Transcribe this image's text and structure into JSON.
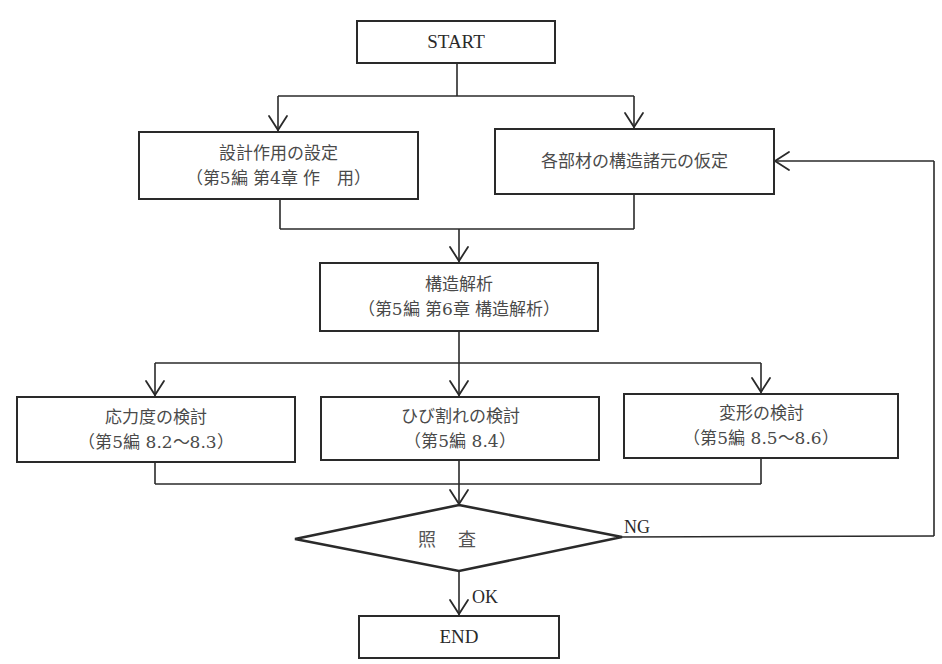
{
  "flowchart": {
    "start": {
      "label": "START"
    },
    "step_design_action": {
      "title": "設計作用の設定",
      "ref": "（第5編 第4章 作　用）"
    },
    "step_member_assumption": {
      "title": "各部材の構造諸元の仮定"
    },
    "step_structural_analysis": {
      "title": "構造解析",
      "ref": "（第5編 第6章 構造解析）"
    },
    "check_stress": {
      "title": "応力度の検討",
      "ref": "（第5編 8.2～8.3）"
    },
    "check_crack": {
      "title": "ひび割れの検討",
      "ref": "（第5編 8.4）"
    },
    "check_deformation": {
      "title": "変形の検討",
      "ref": "（第5編 8.5～8.6）"
    },
    "decision": {
      "label": "照査",
      "yes_label": "OK",
      "no_label": "NG"
    },
    "end": {
      "label": "END"
    }
  },
  "colors": {
    "line": "#2a2a2a",
    "text": "#4a4a4a",
    "background": "#ffffff"
  }
}
